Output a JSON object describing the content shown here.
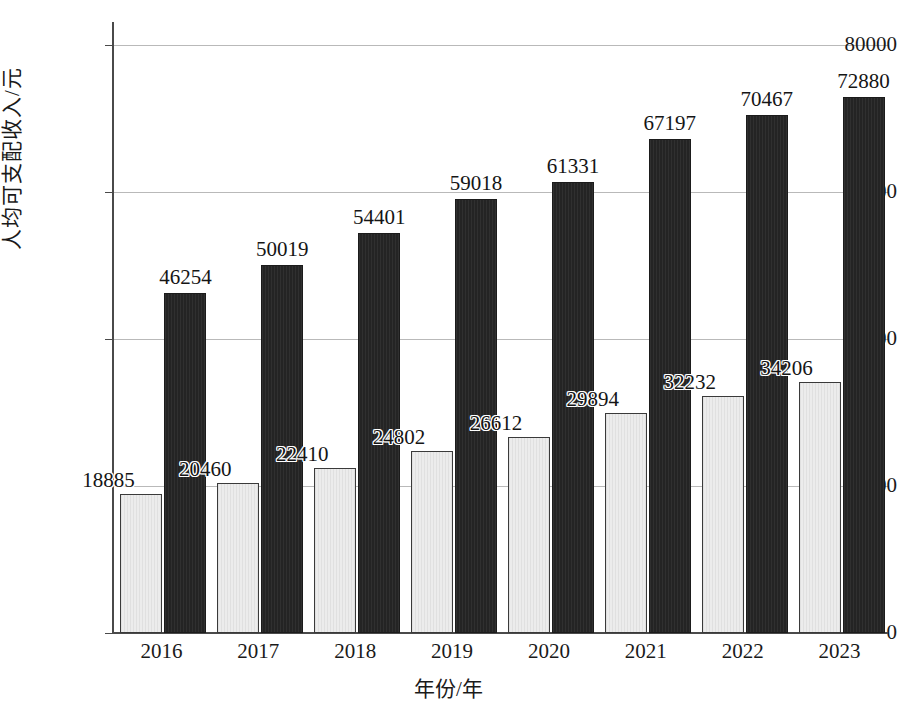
{
  "chart_data": {
    "type": "bar",
    "title": "",
    "xlabel": "年份/年",
    "ylabel": "人均可支配收入/元",
    "categories": [
      "2016",
      "2017",
      "2018",
      "2019",
      "2020",
      "2021",
      "2022",
      "2023"
    ],
    "ylim": [
      0,
      80000
    ],
    "yticks": [
      "0",
      "20000",
      "40000",
      "60000",
      "80000"
    ],
    "ytick_values": [
      0,
      20000,
      40000,
      60000,
      80000
    ],
    "grid": true,
    "legend_position": "none",
    "series": [
      {
        "name": "series-light",
        "color": "#ececec",
        "values": [
          18885,
          20460,
          22410,
          24802,
          26612,
          29894,
          32232,
          34206
        ],
        "labels": [
          "18885",
          "20460",
          "22410",
          "24802",
          "26612",
          "29894",
          "32232",
          "34206"
        ]
      },
      {
        "name": "series-dark",
        "color": "#242424",
        "values": [
          46254,
          50019,
          54401,
          59018,
          61331,
          67197,
          70467,
          72880
        ],
        "labels": [
          "46254",
          "50019",
          "54401",
          "59018",
          "61331",
          "67197",
          "70467",
          "72880"
        ]
      }
    ]
  }
}
